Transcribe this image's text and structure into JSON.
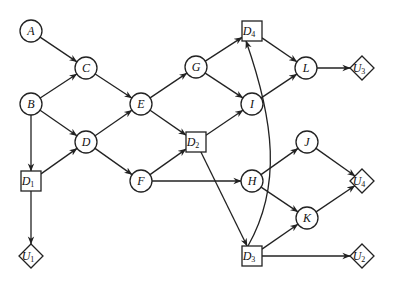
{
  "diagram": {
    "type": "influence-diagram",
    "colors": {
      "stroke": "#222222",
      "fill": "#ffffff",
      "text": "#111111"
    },
    "nodes": [
      {
        "id": "A",
        "label": "A",
        "sub": "",
        "shape": "circle",
        "x": 31,
        "y": 31
      },
      {
        "id": "C",
        "label": "C",
        "sub": "",
        "shape": "circle",
        "x": 86,
        "y": 68
      },
      {
        "id": "B",
        "label": "B",
        "sub": "",
        "shape": "circle",
        "x": 31,
        "y": 104
      },
      {
        "id": "D",
        "label": "D",
        "sub": "",
        "shape": "circle",
        "x": 86,
        "y": 142
      },
      {
        "id": "E",
        "label": "E",
        "sub": "",
        "shape": "circle",
        "x": 141,
        "y": 104
      },
      {
        "id": "G",
        "label": "G",
        "sub": "",
        "shape": "circle",
        "x": 196,
        "y": 67
      },
      {
        "id": "D4",
        "label": "D",
        "sub": "4",
        "shape": "square",
        "x": 252,
        "y": 31
      },
      {
        "id": "L",
        "label": "L",
        "sub": "",
        "shape": "circle",
        "x": 306,
        "y": 68
      },
      {
        "id": "U3",
        "label": "U",
        "sub": "3",
        "shape": "diamond",
        "x": 362,
        "y": 68
      },
      {
        "id": "I",
        "label": "I",
        "sub": "",
        "shape": "circle",
        "x": 252,
        "y": 104
      },
      {
        "id": "D2",
        "label": "D",
        "sub": "2",
        "shape": "square",
        "x": 196,
        "y": 142
      },
      {
        "id": "D1",
        "label": "D",
        "sub": "1",
        "shape": "square",
        "x": 31,
        "y": 181
      },
      {
        "id": "F",
        "label": "F",
        "sub": "",
        "shape": "circle",
        "x": 141,
        "y": 181
      },
      {
        "id": "H",
        "label": "H",
        "sub": "",
        "shape": "circle",
        "x": 252,
        "y": 181
      },
      {
        "id": "J",
        "label": "J",
        "sub": "",
        "shape": "circle",
        "x": 307,
        "y": 142
      },
      {
        "id": "K",
        "label": "K",
        "sub": "",
        "shape": "circle",
        "x": 307,
        "y": 218
      },
      {
        "id": "U4",
        "label": "U",
        "sub": "4",
        "shape": "diamond",
        "x": 362,
        "y": 181
      },
      {
        "id": "D3",
        "label": "D",
        "sub": "3",
        "shape": "square",
        "x": 252,
        "y": 256
      },
      {
        "id": "U2",
        "label": "U",
        "sub": "2",
        "shape": "diamond",
        "x": 362,
        "y": 256
      },
      {
        "id": "U1",
        "label": "U",
        "sub": "1",
        "shape": "diamond",
        "x": 31,
        "y": 256
      }
    ],
    "edges": [
      {
        "from": "A",
        "to": "C"
      },
      {
        "from": "B",
        "to": "C"
      },
      {
        "from": "B",
        "to": "D"
      },
      {
        "from": "B",
        "to": "D1"
      },
      {
        "from": "D1",
        "to": "D"
      },
      {
        "from": "D1",
        "to": "U1"
      },
      {
        "from": "C",
        "to": "E"
      },
      {
        "from": "D",
        "to": "E"
      },
      {
        "from": "D",
        "to": "F"
      },
      {
        "from": "E",
        "to": "G"
      },
      {
        "from": "E",
        "to": "D2"
      },
      {
        "from": "F",
        "to": "D2"
      },
      {
        "from": "F",
        "to": "H"
      },
      {
        "from": "G",
        "to": "D4"
      },
      {
        "from": "G",
        "to": "I"
      },
      {
        "from": "D2",
        "to": "I"
      },
      {
        "from": "D2",
        "to": "D3"
      },
      {
        "from": "D4",
        "to": "L"
      },
      {
        "from": "I",
        "to": "L"
      },
      {
        "from": "L",
        "to": "U3"
      },
      {
        "from": "H",
        "to": "J"
      },
      {
        "from": "H",
        "to": "K"
      },
      {
        "from": "J",
        "to": "U4"
      },
      {
        "from": "K",
        "to": "U4"
      },
      {
        "from": "D3",
        "to": "K"
      },
      {
        "from": "D3",
        "to": "U2"
      },
      {
        "from": "D3",
        "to": "D4",
        "curved": true
      }
    ]
  }
}
